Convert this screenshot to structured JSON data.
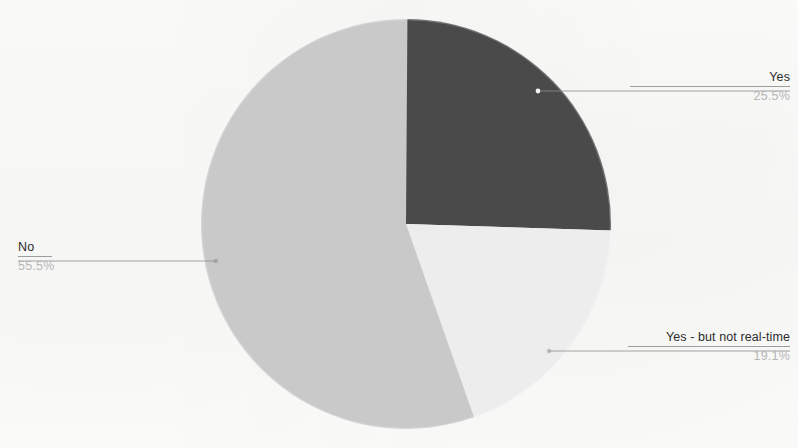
{
  "chart_data": {
    "type": "pie",
    "title": "",
    "subtitle": "",
    "xlabel": "",
    "ylabel": "",
    "legend_position": "callout-labels",
    "grid": false,
    "start_angle_deg": 0,
    "direction": "clockwise",
    "total_percent": 100.1,
    "categories": [
      "Yes",
      "Yes - but not real-time",
      "No"
    ],
    "values": [
      25.5,
      19.1,
      55.5
    ],
    "slices": [
      {
        "label": "Yes",
        "value": 25.5,
        "value_text": "25.5%",
        "color": "#4a4a4a",
        "start_deg": 0.0,
        "sweep_deg": 91.8
      },
      {
        "label": "Yes - but not real-time",
        "value": 19.1,
        "value_text": "19.1%",
        "color": "#ededed",
        "start_deg": 91.8,
        "sweep_deg": 68.8
      },
      {
        "label": "No",
        "value": 55.5,
        "value_text": "55.5%",
        "color": "#c9c9c9",
        "start_deg": 160.6,
        "sweep_deg": 199.8
      }
    ]
  },
  "labels": {
    "yes": {
      "title": "Yes",
      "value": "25.5%"
    },
    "no": {
      "title": "No",
      "value": "55.5%"
    },
    "partial": {
      "title": "Yes - but not real-time",
      "value": "19.1%"
    }
  },
  "colors": {
    "slice_yes": "#4a4a4a",
    "slice_partial": "#ededed",
    "slice_no": "#c9c9c9",
    "leader_line": "#8d8d8d",
    "label_title": "#2b2b2b",
    "label_value": "#b6b6b6",
    "background": "#fdfdfc"
  }
}
